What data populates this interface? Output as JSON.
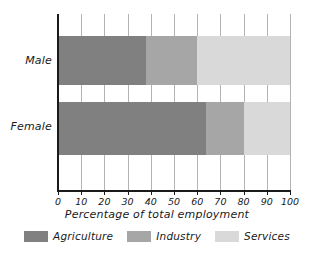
{
  "chart_data": {
    "type": "bar",
    "orientation": "horizontal",
    "stacked": true,
    "stack_mode": "percent",
    "title": "",
    "xlabel": "Percentage of total employment",
    "ylabel": "",
    "xlim": [
      0,
      100
    ],
    "xticks": [
      0,
      10,
      20,
      30,
      40,
      50,
      60,
      70,
      80,
      90,
      100
    ],
    "xtick_labels": [
      "0",
      "10",
      "20",
      "30",
      "40",
      "50",
      "60",
      "70",
      "80",
      "90",
      "100"
    ],
    "grid": "vertical",
    "legend_position": "bottom",
    "categories": [
      "Male",
      "Female"
    ],
    "series": [
      {
        "name": "Agriculture",
        "color": "#808080",
        "values": [
          38,
          64
        ]
      },
      {
        "name": "Industry",
        "color": "#a6a6a6",
        "values": [
          22,
          16
        ]
      },
      {
        "name": "Services",
        "color": "#d9d9d9",
        "values": [
          40,
          20
        ]
      }
    ]
  },
  "axis": {
    "x_title": "Percentage of total employment"
  },
  "categories": {
    "male": "Male",
    "female": "Female"
  },
  "ticks": {
    "t0": "0",
    "t1": "10",
    "t2": "20",
    "t3": "30",
    "t4": "40",
    "t5": "50",
    "t6": "60",
    "t7": "70",
    "t8": "80",
    "t9": "90",
    "t10": "100"
  },
  "legend": {
    "items": [
      {
        "label": "Agriculture",
        "color": "#808080"
      },
      {
        "label": "Industry",
        "color": "#a6a6a6"
      },
      {
        "label": "Services",
        "color": "#d9d9d9"
      }
    ]
  },
  "colors": {
    "agriculture": "#808080",
    "industry": "#a6a6a6",
    "services": "#d9d9d9",
    "axis": "#1a1a1a",
    "gridline": "#b3b3b3",
    "background": "#ffffff"
  }
}
